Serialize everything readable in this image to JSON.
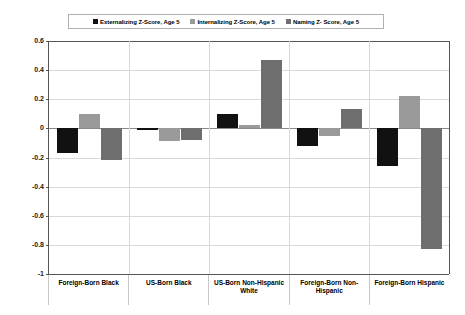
{
  "chart_data": {
    "type": "bar",
    "title": "",
    "subtitle": "",
    "xlabel": "",
    "ylabel": "",
    "ylim": [
      -1,
      0.6
    ],
    "yticks": [
      0.6,
      0.4,
      0.2,
      0,
      -0.2,
      -0.4,
      -0.6,
      -0.8,
      -1
    ],
    "ytick_labels": [
      "0.6",
      "0.4",
      "0.2",
      "0",
      "-0.2",
      "-0.4",
      "-0.6",
      "-0.8",
      "-1"
    ],
    "grid": true,
    "legend_position": "top-center",
    "categories": [
      "Foreign-Born Black",
      "US-Born Black",
      "US-Born Non-Hispanic White",
      "Foreign-Born Non-Hispanic",
      "Foreign-Born Hispanic"
    ],
    "series": [
      {
        "name": "Externalizing Z-Score, Age 5",
        "color": "#111111",
        "values": [
          -0.17,
          -0.01,
          0.1,
          -0.12,
          -0.26
        ]
      },
      {
        "name": "Internalizing  Z-Score, Age 5",
        "color": "#9a9a9a",
        "values": [
          0.1,
          -0.09,
          0.02,
          -0.05,
          0.22
        ]
      },
      {
        "name": "Naming Z- Score, Age 5",
        "color": "#6e6e6e",
        "values": [
          -0.22,
          -0.08,
          0.47,
          0.13,
          -0.83
        ]
      }
    ]
  },
  "legend": {
    "entries": [
      {
        "label": "Externalizing Z-Score, Age 5",
        "swatch": "#111111"
      },
      {
        "label": "Internalizing  Z-Score, Age 5",
        "swatch": "#9a9a9a"
      },
      {
        "label": "Naming Z- Score, Age 5",
        "swatch": "#6e6e6e"
      }
    ]
  }
}
